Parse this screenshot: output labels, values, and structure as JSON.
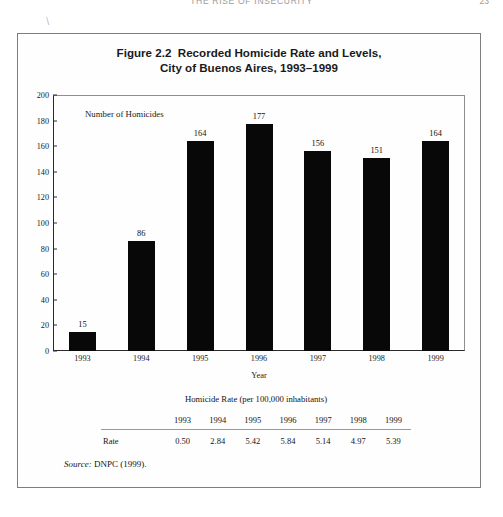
{
  "running_head": {
    "title": "THE RISE OF INSECURITY",
    "page_number": "23"
  },
  "stray_mark": "\\",
  "figure": {
    "caption_line_1": "Figure 2.2  Recorded Homicide Rate and Levels,",
    "caption_line_2": "City of Buenos Aires, 1993–1999",
    "source_label": "Source:",
    "source_text": " DNPC (1999)."
  },
  "chart_data": {
    "type": "bar",
    "title": "Figure 2.2  Recorded Homicide Rate and Levels, City of Buenos Aires, 1993–1999",
    "annotation": "Number of Homicides",
    "categories": [
      "1993",
      "1994",
      "1995",
      "1996",
      "1997",
      "1998",
      "1999"
    ],
    "values": [
      15,
      86,
      164,
      177,
      156,
      151,
      164
    ],
    "xlabel": "Year",
    "ylabel": "",
    "ylim": [
      0,
      200
    ],
    "yticks": [
      0,
      20,
      40,
      60,
      80,
      100,
      120,
      140,
      160,
      180,
      200
    ],
    "ytick_labels": [
      "0",
      "20",
      "40",
      "60",
      "80",
      "100",
      "120",
      "140",
      "160",
      "180",
      "200"
    ],
    "grid": false,
    "legend": false,
    "bar_color": "#080808"
  },
  "table": {
    "title": "Homicide Rate (per 100,000 inhabitants)",
    "row_header_blank": "",
    "columns": [
      "1993",
      "1994",
      "1995",
      "1996",
      "1997",
      "1998",
      "1999"
    ],
    "rows": [
      {
        "label": "Rate",
        "values": [
          "0.50",
          "2.84",
          "5.42",
          "5.84",
          "5.14",
          "4.97",
          "5.39"
        ]
      }
    ]
  }
}
